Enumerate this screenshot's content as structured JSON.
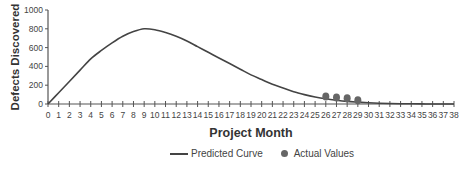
{
  "chart_data": {
    "type": "line",
    "title": "",
    "xlabel": "Project Month",
    "ylabel": "Defects Discovered",
    "xlim": [
      0,
      38
    ],
    "ylim": [
      0,
      1000
    ],
    "y_ticks": [
      0,
      200,
      400,
      600,
      800,
      1000
    ],
    "x_ticks": [
      0,
      1,
      2,
      3,
      4,
      5,
      6,
      7,
      8,
      9,
      10,
      11,
      12,
      13,
      14,
      15,
      16,
      17,
      18,
      19,
      20,
      21,
      22,
      23,
      24,
      25,
      26,
      27,
      28,
      29,
      30,
      31,
      32,
      33,
      34,
      35,
      36,
      37,
      38
    ],
    "grid": false,
    "legend_position": "bottom",
    "series": [
      {
        "name": "Predicted Curve",
        "style": "line",
        "color": "#444444",
        "x": [
          0,
          1,
          2,
          3,
          4,
          5,
          6,
          7,
          8,
          9,
          10,
          11,
          12,
          13,
          14,
          15,
          16,
          17,
          18,
          19,
          20,
          21,
          22,
          23,
          24,
          25,
          26,
          27,
          28,
          29,
          30,
          31,
          32,
          33,
          34,
          35,
          36,
          37,
          38
        ],
        "values": [
          0,
          120,
          240,
          360,
          480,
          570,
          650,
          720,
          770,
          800,
          790,
          760,
          720,
          670,
          610,
          550,
          490,
          430,
          370,
          310,
          260,
          210,
          170,
          130,
          100,
          75,
          55,
          40,
          28,
          20,
          13,
          8,
          5,
          3,
          2,
          1,
          0,
          0,
          0
        ]
      },
      {
        "name": "Actual Values",
        "style": "scatter",
        "color": "#666666",
        "x": [
          26,
          27,
          28,
          29
        ],
        "values": [
          80,
          70,
          60,
          40
        ]
      }
    ]
  },
  "legend": {
    "predicted_label": "Predicted Curve",
    "actual_label": "Actual Values"
  }
}
